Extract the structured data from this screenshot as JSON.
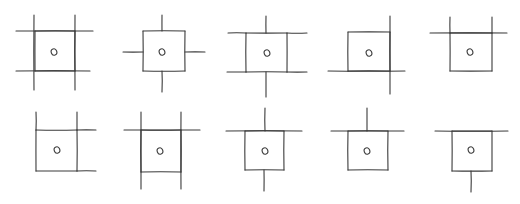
{
  "diagram": {
    "stroke_color": "#3a3a3a",
    "background": "#ffffff",
    "rows": 2,
    "columns": 5,
    "panels": [
      {
        "id": 1,
        "box": [
          35,
          31,
          75,
          71
        ],
        "dot": [
          54,
          52
        ],
        "lines": [
          [
            16,
            31,
            93,
            31
          ],
          [
            16,
            71,
            90,
            71
          ],
          [
            34,
            15,
            34,
            90
          ],
          [
            75,
            15,
            75,
            90
          ]
        ]
      },
      {
        "id": 2,
        "box": [
          143,
          31,
          185,
          71
        ],
        "dot": [
          162,
          52
        ],
        "lines": [
          [
            162,
            15,
            162,
            31
          ],
          [
            162,
            71,
            162,
            92
          ],
          [
            123,
            52,
            143,
            52
          ],
          [
            185,
            52,
            205,
            52
          ]
        ]
      },
      {
        "id": 3,
        "box": [
          246,
          33,
          287,
          72
        ],
        "dot": [
          267,
          53
        ],
        "lines": [
          [
            266,
            16,
            266,
            33
          ],
          [
            266,
            72,
            266,
            97
          ],
          [
            228,
            33,
            246,
            33
          ],
          [
            227,
            72,
            246,
            72
          ],
          [
            287,
            33,
            307,
            33
          ],
          [
            287,
            72,
            307,
            72
          ]
        ]
      },
      {
        "id": 4,
        "box": [
          348,
          32,
          390,
          71
        ],
        "dot": [
          369,
          53
        ],
        "lines": [
          [
            390,
            16,
            390,
            94
          ],
          [
            328,
            71,
            405,
            71
          ]
        ]
      },
      {
        "id": 5,
        "box": [
          450,
          33,
          492,
          71
        ],
        "dot": [
          470,
          52
        ],
        "lines": [
          [
            430,
            33,
            507,
            33
          ],
          [
            450,
            17,
            450,
            33
          ],
          [
            492,
            17,
            492,
            33
          ]
        ]
      },
      {
        "id": 6,
        "box": [
          36,
          130,
          77,
          171
        ],
        "dot": [
          57,
          150
        ],
        "lines": [
          [
            36,
            112,
            36,
            130
          ],
          [
            77,
            112,
            77,
            130
          ],
          [
            77,
            130,
            96,
            130
          ],
          [
            77,
            171,
            96,
            171
          ]
        ]
      },
      {
        "id": 7,
        "box": [
          141,
          130,
          181,
          172
        ],
        "dot": [
          160,
          151
        ],
        "lines": [
          [
            124,
            130,
            200,
            130
          ],
          [
            141,
            112,
            141,
            189
          ],
          [
            181,
            112,
            181,
            189
          ]
        ]
      },
      {
        "id": 8,
        "box": [
          245,
          131,
          284,
          170
        ],
        "dot": [
          265,
          151
        ],
        "lines": [
          [
            226,
            131,
            302,
            131
          ],
          [
            265,
            108,
            265,
            131
          ],
          [
            264,
            170,
            264,
            191
          ]
        ]
      },
      {
        "id": 9,
        "box": [
          348,
          131,
          388,
          170
        ],
        "dot": [
          367,
          151
        ],
        "lines": [
          [
            331,
            131,
            404,
            131
          ],
          [
            367,
            108,
            367,
            131
          ]
        ]
      },
      {
        "id": 10,
        "box": [
          452,
          131,
          492,
          171
        ],
        "dot": [
          471,
          150
        ],
        "lines": [
          [
            435,
            131,
            508,
            131
          ],
          [
            471,
            171,
            471,
            192
          ]
        ]
      }
    ]
  }
}
